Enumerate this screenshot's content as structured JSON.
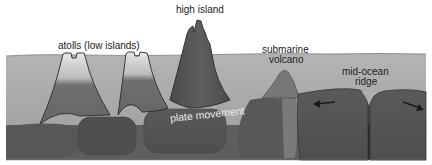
{
  "diagram": {
    "type": "cross-section",
    "labels": {
      "high_island": "high island",
      "atolls": "atolls (low islands)",
      "submarine_volcano_line1": "submarine",
      "submarine_volcano_line2": "volcano",
      "mid_ocean_ridge_line1": "mid-ocean",
      "mid_ocean_ridge_line2": "ridge",
      "plate_movement": "plate movement"
    },
    "arrows": [
      {
        "name": "left-plate-arrow",
        "direction": "left"
      },
      {
        "name": "right-plate-arrow",
        "direction": "right"
      }
    ],
    "colors": {
      "background": "#ffffff",
      "ocean": "#a9a9a9",
      "ocean_surface": "#8a8a8a",
      "seamount": "#6e6e6e",
      "high_island": "#555555",
      "plate": "#5c5c5c",
      "plate_dark": "#4a4a4a",
      "mantle": "#606060",
      "outline": "#2a2a2a",
      "reef_top": "#d6d6d6"
    }
  }
}
